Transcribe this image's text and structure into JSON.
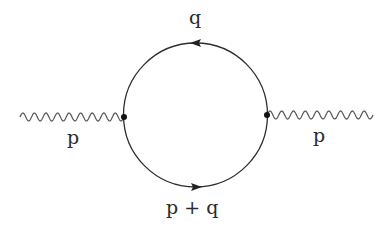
{
  "diagram": {
    "type": "feynman-diagram",
    "colors": {
      "line": "#2e2e2e",
      "wave": "#555555",
      "background": "#ffffff"
    },
    "loop": {
      "center": [
        195.5,
        115
      ],
      "radius": 72,
      "upper_arrow": {
        "direction": "left",
        "label": "q"
      },
      "lower_arrow": {
        "direction": "right",
        "label": "p + q"
      }
    },
    "vertices": [
      {
        "name": "left-vertex",
        "x": 124,
        "y": 117
      },
      {
        "name": "right-vertex",
        "x": 267,
        "y": 115
      }
    ],
    "external_lines": [
      {
        "name": "incoming-photon",
        "style": "wavy",
        "from": [
          20,
          117
        ],
        "to": [
          124,
          117
        ],
        "label": "p"
      },
      {
        "name": "outgoing-photon",
        "style": "wavy",
        "from": [
          267,
          115
        ],
        "to": [
          373,
          115
        ],
        "label": "p"
      }
    ]
  },
  "labels": {
    "top": "q",
    "bottom": "p + q",
    "left": "p",
    "right": "p"
  }
}
